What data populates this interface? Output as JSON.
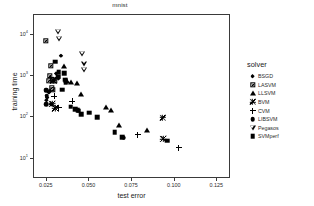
{
  "chart_data": {
    "type": "scatter",
    "title": "mnist",
    "xlabel": "test error",
    "ylabel": "training time",
    "xlim": [
      0.0175,
      0.133
    ],
    "ylim_log": [
      3.2,
      30000
    ],
    "xticks": [
      "0.025",
      "0.050",
      "0.075",
      "0.100",
      "0.125"
    ],
    "xtick_values": [
      0.025,
      0.05,
      0.075,
      0.1,
      0.125
    ],
    "yticks": [
      "10",
      "10",
      "10",
      "10"
    ],
    "ytick_exponents": [
      "1",
      "2",
      "3",
      "4"
    ],
    "ytick_values": [
      10,
      100,
      1000,
      10000
    ],
    "grid": false,
    "legend_position": "right",
    "legend_title": "solver",
    "series": [
      {
        "name": "BSGD",
        "marker": "filled-diamond",
        "points": [
          {
            "x": 0.0333,
            "y": 3100
          },
          {
            "x": 0.0305,
            "y": 1150
          },
          {
            "x": 0.0268,
            "y": 430
          },
          {
            "x": 0.0262,
            "y": 400
          },
          {
            "x": 0.0252,
            "y": 300
          },
          {
            "x": 0.0248,
            "y": 260
          },
          {
            "x": 0.0318,
            "y": 870
          },
          {
            "x": 0.0275,
            "y": 205
          }
        ]
      },
      {
        "name": "LASVM",
        "marker": "crossed-square",
        "points": [
          {
            "x": 0.0243,
            "y": 7100
          },
          {
            "x": 0.0272,
            "y": 1750
          },
          {
            "x": 0.0268,
            "y": 1000
          },
          {
            "x": 0.0288,
            "y": 790
          },
          {
            "x": 0.0295,
            "y": 760
          },
          {
            "x": 0.028,
            "y": 500
          },
          {
            "x": 0.0285,
            "y": 470
          },
          {
            "x": 0.0262,
            "y": 760
          }
        ]
      },
      {
        "name": "LLSVM",
        "marker": "filled-triangle",
        "points": [
          {
            "x": 0.0352,
            "y": 1700
          },
          {
            "x": 0.036,
            "y": 790
          },
          {
            "x": 0.0368,
            "y": 760
          },
          {
            "x": 0.0392,
            "y": 700
          },
          {
            "x": 0.0428,
            "y": 660
          },
          {
            "x": 0.0452,
            "y": 370
          },
          {
            "x": 0.06,
            "y": 182
          },
          {
            "x": 0.0628,
            "y": 150
          },
          {
            "x": 0.0672,
            "y": 66
          },
          {
            "x": 0.0838,
            "y": 50
          }
        ]
      },
      {
        "name": "BVM",
        "marker": "asterisk",
        "points": [
          {
            "x": 0.0288,
            "y": 780
          },
          {
            "x": 0.0283,
            "y": 215
          },
          {
            "x": 0.03,
            "y": 165
          },
          {
            "x": 0.093,
            "y": 98
          },
          {
            "x": 0.0932,
            "y": 30
          }
        ]
      },
      {
        "name": "CVM",
        "marker": "plus",
        "points": [
          {
            "x": 0.0272,
            "y": 900
          },
          {
            "x": 0.0295,
            "y": 325
          },
          {
            "x": 0.032,
            "y": 170
          },
          {
            "x": 0.04,
            "y": 245
          },
          {
            "x": 0.0782,
            "y": 38
          },
          {
            "x": 0.1025,
            "y": 18
          }
        ]
      },
      {
        "name": "LIBSVM",
        "marker": "filled-circle",
        "points": [
          {
            "x": 0.0248,
            "y": 470
          },
          {
            "x": 0.0245,
            "y": 445
          },
          {
            "x": 0.025,
            "y": 330
          },
          {
            "x": 0.0246,
            "y": 205
          },
          {
            "x": 0.07,
            "y": 32
          }
        ]
      },
      {
        "name": "Pegasos",
        "marker": "open-down-triangle",
        "points": [
          {
            "x": 0.0318,
            "y": 11500
          },
          {
            "x": 0.0322,
            "y": 10200
          },
          {
            "x": 0.0458,
            "y": 5800
          },
          {
            "x": 0.0468,
            "y": 4600
          },
          {
            "x": 0.047,
            "y": 4200
          }
        ]
      },
      {
        "name": "SVMperf",
        "marker": "filled-square",
        "points": [
          {
            "x": 0.03,
            "y": 2200
          },
          {
            "x": 0.032,
            "y": 1250
          },
          {
            "x": 0.0318,
            "y": 960
          },
          {
            "x": 0.0352,
            "y": 1150
          },
          {
            "x": 0.0358,
            "y": 820
          },
          {
            "x": 0.0362,
            "y": 700
          },
          {
            "x": 0.034,
            "y": 470
          },
          {
            "x": 0.039,
            "y": 180
          },
          {
            "x": 0.0418,
            "y": 155
          },
          {
            "x": 0.0432,
            "y": 148
          },
          {
            "x": 0.0438,
            "y": 145
          },
          {
            "x": 0.0452,
            "y": 118
          },
          {
            "x": 0.05,
            "y": 130
          },
          {
            "x": 0.0545,
            "y": 100
          },
          {
            "x": 0.0648,
            "y": 44
          },
          {
            "x": 0.0692,
            "y": 33
          },
          {
            "x": 0.0955,
            "y": 27
          }
        ]
      }
    ]
  }
}
